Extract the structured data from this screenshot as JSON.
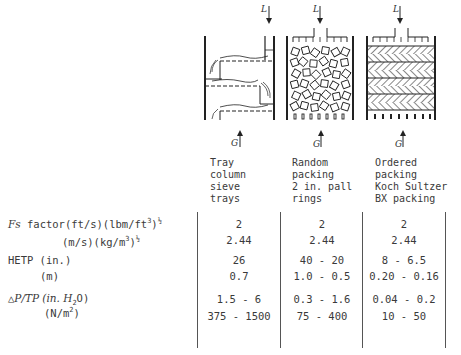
{
  "columns": [
    {
      "id": "tray",
      "header_lines": [
        "Tray",
        "column",
        "sieve",
        "trays"
      ],
      "drawing": "tray-column"
    },
    {
      "id": "random",
      "header_lines": [
        "Random",
        "packing",
        "2 in. pall",
        "rings"
      ],
      "drawing": "random-packing"
    },
    {
      "id": "ordered",
      "header_lines": [
        "Ordered",
        "packing",
        "Koch Sultzer",
        "BX packing"
      ],
      "drawing": "ordered-packing"
    }
  ],
  "flow_labels": {
    "liquid": "L",
    "gas": "G"
  },
  "rows": {
    "fs_factor": {
      "label_symbol": "Fs",
      "label_rest": " factor(ft/s)(lbm/ft",
      "label_sup": "3",
      "label_tail": ")",
      "label_exp": "½",
      "si_label_a": "(m/s)(kg/m",
      "si_sup": "3",
      "si_tail": ")",
      "si_exp": "½",
      "values_us": [
        "2",
        "2",
        "2"
      ],
      "values_si": [
        "2.44",
        "2.44",
        "2.44"
      ]
    },
    "hetp": {
      "label_us": "HETP (in.)",
      "label_si": "(m)",
      "values_us": [
        "26",
        "40 - 20",
        "8 - 6.5"
      ],
      "values_si": [
        "0.7",
        "1.0 - 0.5",
        "0.20 - 0.16"
      ]
    },
    "pressure_drop": {
      "label_a": "△",
      "label_b": "P/TP (in. H",
      "label_sub": "2",
      "label_c": "O)",
      "si_label_a": "(N/m",
      "si_sup": "2",
      "si_tail": ")",
      "values_us": [
        "1.5 - 6",
        "0.3 - 1.6",
        "0.04 - 0.2"
      ],
      "values_si": [
        "375 - 1500",
        "75 - 400",
        "10 - 50"
      ]
    }
  }
}
